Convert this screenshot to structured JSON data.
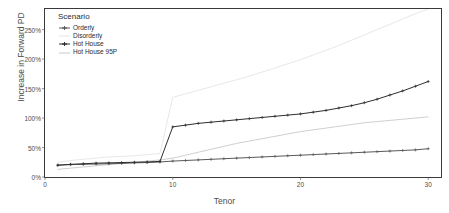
{
  "chart_data": {
    "type": "line",
    "title": "",
    "xlabel": "Tenor",
    "ylabel": "Increase in Forward PD",
    "xlim": [
      0,
      31
    ],
    "ylim": [
      0,
      285
    ],
    "xticks": [
      0,
      10,
      20,
      30
    ],
    "xtick_labels": [
      "0",
      "10",
      "20",
      "30"
    ],
    "yticks": [
      0,
      50,
      100,
      150,
      200,
      250
    ],
    "ytick_labels": [
      "0%",
      "50%",
      "100%",
      "150%",
      "200%",
      "250%"
    ],
    "grid": false,
    "legend_position": "top-left-inside",
    "legend_title": "Scenario",
    "x": [
      1,
      2,
      3,
      4,
      5,
      6,
      7,
      8,
      9,
      10,
      11,
      12,
      13,
      14,
      15,
      16,
      17,
      18,
      19,
      20,
      21,
      22,
      23,
      24,
      25,
      26,
      27,
      28,
      29,
      30
    ],
    "series": [
      {
        "name": "Orderly",
        "color": "#5a5a5a",
        "marker": "plus",
        "values": [
          20,
          21,
          21.5,
          22,
          22.5,
          23,
          24,
          24.5,
          25.5,
          27,
          28,
          29,
          30,
          31,
          32,
          33,
          34,
          35,
          36,
          37,
          38,
          39,
          40,
          41,
          42,
          43,
          44,
          45,
          46,
          48
        ]
      },
      {
        "name": "Disorderly",
        "color": "#e4e4e4",
        "marker": "none",
        "values": [
          25,
          28,
          30,
          32,
          34,
          35,
          36,
          38,
          40,
          135,
          141,
          147,
          153,
          159,
          165,
          171,
          178,
          185,
          192,
          199,
          207,
          215,
          223,
          232,
          241,
          250,
          259,
          268,
          277,
          285
        ]
      },
      {
        "name": "Hot House",
        "color": "#2f2f2f",
        "marker": "plus",
        "values": [
          20,
          21.5,
          22.5,
          23.5,
          24,
          24.5,
          25,
          25.5,
          26.5,
          85,
          88,
          91,
          93,
          95,
          97,
          99,
          101,
          103,
          105,
          107,
          110,
          113,
          117,
          121,
          126,
          132,
          139,
          146,
          154,
          162
        ]
      },
      {
        "name": "Hot House 95P",
        "color": "#c9c9c9",
        "marker": "none",
        "values": [
          13,
          15,
          17,
          19,
          21,
          23,
          25,
          27,
          29,
          32,
          37,
          42,
          47,
          52,
          57,
          61,
          65,
          69,
          73,
          77,
          80,
          83,
          86,
          89,
          92,
          94,
          96,
          98,
          100,
          102
        ]
      }
    ]
  },
  "legend": {
    "title": "Scenario",
    "items": [
      {
        "label": "Orderly",
        "color": "#5a5a5a",
        "marker": "plus"
      },
      {
        "label": "Disorderly",
        "color": "#e4e4e4",
        "marker": "none"
      },
      {
        "label": "Hot House",
        "color": "#2f2f2f",
        "marker": "plus"
      },
      {
        "label": "Hot House 95P",
        "color": "#c9c9c9",
        "marker": "none"
      }
    ]
  },
  "axes": {
    "x_title": "Tenor",
    "y_title": "Increase in Forward PD"
  }
}
